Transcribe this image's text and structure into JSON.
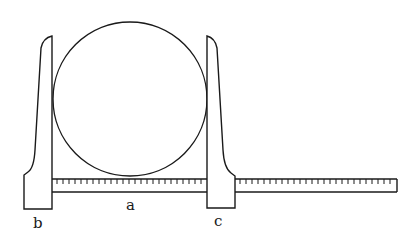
{
  "diagram": {
    "labels": {
      "left_jaw": "b",
      "scale": "a",
      "right_jaw": "c"
    },
    "colors": {
      "stroke": "#1a1a1a",
      "background": "#ffffff"
    },
    "ruler": {
      "tick_count_left": 26,
      "tick_count_right": 26
    }
  }
}
